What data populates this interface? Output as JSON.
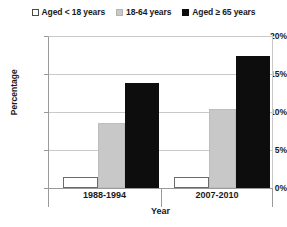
{
  "chart_data": {
    "type": "bar",
    "title": "",
    "subtitle": "",
    "xlabel": "Year",
    "ylabel": "Percentage",
    "categories": [
      "1988-1994",
      "2007-2010"
    ],
    "series": [
      {
        "name": "Aged < 18 years",
        "values": [
          1.5,
          1.5
        ],
        "color": "#ffffff",
        "swatch": "sw-white"
      },
      {
        "name": "18-64 years",
        "values": [
          8.6,
          10.5
        ],
        "color": "#c8c8c8",
        "swatch": "sw-gray"
      },
      {
        "name": "Aged ≥ 65 years",
        "values": [
          13.9,
          17.5
        ],
        "color": "#0d0d0d",
        "swatch": "sw-black"
      }
    ],
    "ylim": [
      0,
      20
    ],
    "yticks": [
      0,
      5,
      10,
      15,
      20
    ],
    "ytick_labels": [
      "0%",
      "5%",
      "10%",
      "15%",
      "20%"
    ],
    "grid": true,
    "legend_position": "top"
  },
  "legend": {
    "entries": [
      {
        "label": "Aged < 18 years"
      },
      {
        "label": "18-64 years"
      },
      {
        "label": "Aged ≥ 65 years"
      }
    ]
  },
  "axes": {
    "y_title": "Percentage",
    "x_title": "Year",
    "y_labels": [
      "20%",
      "15%",
      "10%",
      "5%",
      "0%"
    ],
    "x_labels": [
      "1988-1994",
      "2007-2010"
    ]
  }
}
